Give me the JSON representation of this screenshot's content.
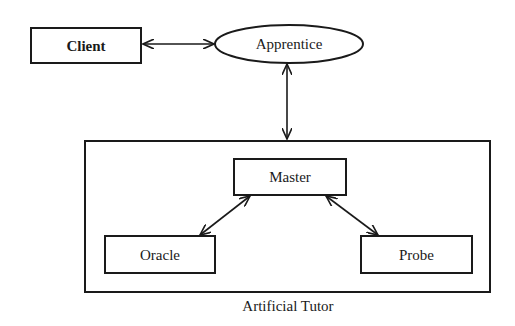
{
  "diagram": {
    "type": "architecture",
    "colors": {
      "stroke": "#1a1a1a",
      "background": "#ffffff"
    },
    "nodes": {
      "client": {
        "label": "Client",
        "shape": "rectangle",
        "bold": true
      },
      "apprentice": {
        "label": "Apprentice",
        "shape": "ellipse"
      },
      "master": {
        "label": "Master",
        "shape": "rectangle"
      },
      "oracle": {
        "label": "Oracle",
        "shape": "rectangle"
      },
      "probe": {
        "label": "Probe",
        "shape": "rectangle"
      }
    },
    "group": {
      "label": "Artificial Tutor",
      "contains": [
        "master",
        "oracle",
        "probe"
      ]
    },
    "edges": [
      {
        "from": "client",
        "to": "apprentice",
        "direction": "bidirectional"
      },
      {
        "from": "apprentice",
        "to": "artificial-tutor",
        "direction": "bidirectional"
      },
      {
        "from": "master",
        "to": "oracle",
        "direction": "bidirectional"
      },
      {
        "from": "master",
        "to": "probe",
        "direction": "bidirectional"
      }
    ]
  }
}
